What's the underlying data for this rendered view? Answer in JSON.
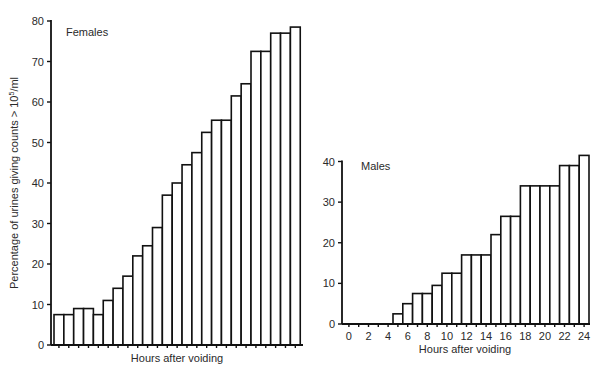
{
  "chart_data": [
    {
      "type": "bar",
      "title": "Females",
      "xlabel": "Hours after voiding",
      "ylabel": "Percentage of urines giving counts > 10^5/ml",
      "ylim": [
        0,
        80
      ],
      "yticks": [
        0,
        10,
        20,
        30,
        40,
        50,
        60,
        70,
        80
      ],
      "grid": false,
      "categories": [
        0,
        1,
        2,
        3,
        4,
        5,
        6,
        7,
        8,
        9,
        10,
        11,
        12,
        13,
        14,
        15,
        16,
        17,
        18,
        19,
        20,
        21,
        22,
        23,
        24
      ],
      "values": [
        7.5,
        7.5,
        9,
        9,
        7.5,
        11,
        14,
        17,
        22,
        24.5,
        29,
        37,
        40,
        44.5,
        47.5,
        52.5,
        55.5,
        55.5,
        61.5,
        64.5,
        72.5,
        72.5,
        77,
        77,
        78.5
      ]
    },
    {
      "type": "bar",
      "title": "Males",
      "xlabel": "Hours after voiding",
      "ylabel": "",
      "ylim": [
        0,
        40
      ],
      "yticks": [
        0,
        10,
        20,
        30,
        40
      ],
      "xticks": [
        0,
        2,
        4,
        6,
        8,
        10,
        12,
        14,
        16,
        18,
        20,
        22,
        24
      ],
      "grid": false,
      "categories": [
        0,
        1,
        2,
        3,
        4,
        5,
        6,
        7,
        8,
        9,
        10,
        11,
        12,
        13,
        14,
        15,
        16,
        17,
        18,
        19,
        20,
        21,
        22,
        23,
        24
      ],
      "values": [
        0,
        0,
        0,
        0,
        0,
        2.5,
        5,
        7.5,
        7.5,
        9.5,
        12.5,
        12.5,
        17,
        17,
        17,
        22,
        26.5,
        26.5,
        34,
        34,
        34,
        34,
        39,
        39,
        41.5
      ]
    }
  ],
  "labels": {
    "females_title": "Females",
    "males_title": "Males",
    "y_axis_label_main": "Percentage of urines giving counts > 10",
    "y_axis_label_sup": "5",
    "y_axis_label_unit": "/ml",
    "x_axis_label_females": "Hours after voiding",
    "x_axis_label_males": "Hours after voiding"
  }
}
